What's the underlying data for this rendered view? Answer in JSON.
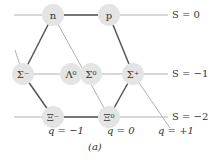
{
  "figure_label": "(a)",
  "particles": [
    {
      "id": "n",
      "label": "n",
      "x": 53,
      "y": 15
    },
    {
      "id": "p",
      "label": "p",
      "x": 109,
      "y": 15
    },
    {
      "id": "sigma-minus",
      "label": "Σ⁻",
      "x": 23,
      "y": 74
    },
    {
      "id": "lambda-0",
      "label": "Λ⁰",
      "x": 71,
      "y": 74
    },
    {
      "id": "sigma-0",
      "label": "Σ⁰",
      "x": 91,
      "y": 74
    },
    {
      "id": "sigma-plus",
      "label": "Σ⁺",
      "x": 133,
      "y": 74
    },
    {
      "id": "xi-minus",
      "label": "Ξ⁻",
      "x": 53,
      "y": 117
    },
    {
      "id": "xi-0",
      "label": "Ξ⁰",
      "x": 109,
      "y": 117
    }
  ],
  "strangeness_labels": [
    "S = 0",
    "S = −1",
    "S = −2"
  ],
  "charge_labels": [
    "q = −1",
    "q = 0",
    "q = +1"
  ],
  "colors": {
    "node": "#e4e4e4",
    "thick_line": "#555555",
    "thin_line": "#b0b0b0"
  }
}
